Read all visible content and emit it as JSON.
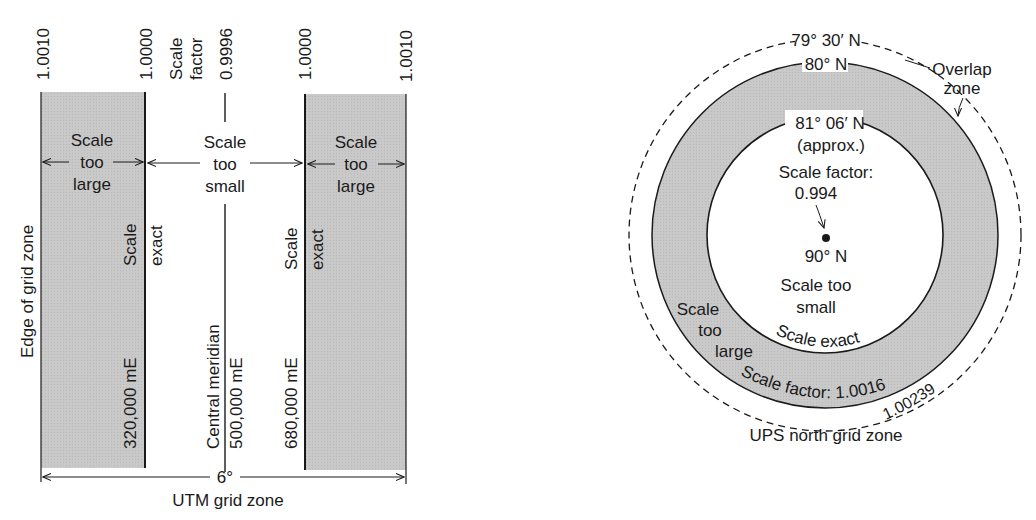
{
  "utm": {
    "scale_factor_label": [
      "Scale",
      "factor"
    ],
    "factors": {
      "left_edge": "1.0010",
      "left_exact": "1.0000",
      "central": "0.9996",
      "right_exact": "1.0000",
      "right_edge": "1.0010"
    },
    "left_band": [
      "Scale",
      "too",
      "large"
    ],
    "middle_band": [
      "Scale",
      "too",
      "small"
    ],
    "right_band": [
      "Scale",
      "too",
      "large"
    ],
    "edge_label": "Edge of grid zone",
    "left_exact_label": [
      "Scale",
      "exact"
    ],
    "right_exact_label": [
      "Scale",
      "exact"
    ],
    "left_easting": "320,000 mE",
    "central_meridian": "Central meridian",
    "central_easting": "500,000 mE",
    "right_easting": "680,000 mE",
    "width_label": "6°",
    "caption": "UTM grid zone"
  },
  "ups": {
    "outer_lat": "79° 30′ N",
    "gray_lat": "80° N",
    "overlap": [
      "Overlap",
      "zone"
    ],
    "inner_lat": "81° 06′ N",
    "approx": "(approx.)",
    "scale_factor_label": "Scale factor:",
    "scale_factor_value": "0.994",
    "pole": "90° N",
    "too_small": [
      "Scale too",
      "small"
    ],
    "too_large": [
      "Scale",
      "too",
      "large"
    ],
    "exact": "Scale exact",
    "factor_outer": "Scale factor: 1.0016",
    "factor_edge": "1.00239",
    "caption": "UPS north grid zone"
  },
  "colors": {
    "band": "#c4c4c4",
    "ink": "#1a1a1a"
  }
}
